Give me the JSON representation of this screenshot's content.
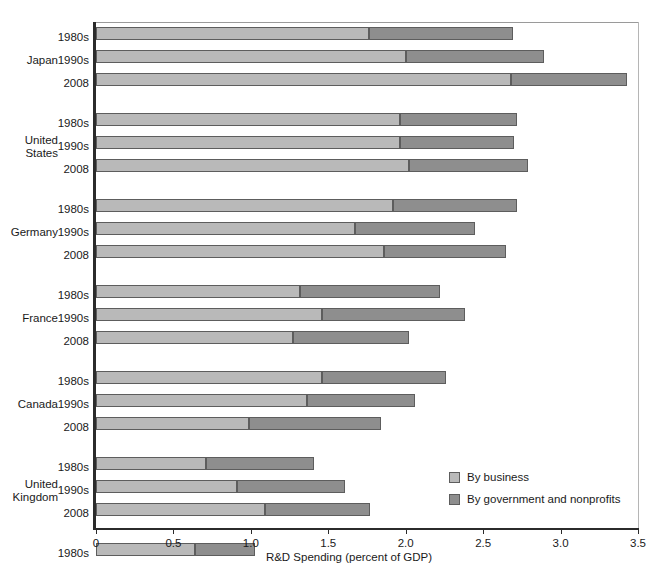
{
  "chart_data": {
    "type": "bar",
    "orientation": "horizontal",
    "stacked": true,
    "title": "",
    "xlabel": "R&D Spending (percent of GDP)",
    "ylabel": "",
    "xlim": [
      0,
      3.5
    ],
    "xticks": [
      "0",
      "0.5",
      "1.0",
      "1.5",
      "2.0",
      "2.5",
      "3.0",
      "3.5"
    ],
    "xtick_values": [
      0,
      0.5,
      1.0,
      1.5,
      2.0,
      2.5,
      3.0,
      3.5
    ],
    "grid": false,
    "legend_position": "inside-bottom-right",
    "series": [
      {
        "name": "By business",
        "color": "#b9b9b9"
      },
      {
        "name": "By government and nonprofits",
        "color": "#8e8e8e"
      }
    ],
    "groups": [
      {
        "country": "Japan",
        "rows": [
          {
            "period": "1980s",
            "business": 1.76,
            "government": 0.93,
            "total": 2.69
          },
          {
            "period": "1990s",
            "business": 2.0,
            "government": 0.89,
            "total": 2.89
          },
          {
            "period": "2008",
            "business": 2.68,
            "government": 0.75,
            "total": 3.43
          }
        ]
      },
      {
        "country": "United States",
        "rows": [
          {
            "period": "1980s",
            "business": 1.96,
            "government": 0.76,
            "total": 2.72
          },
          {
            "period": "1990s",
            "business": 1.96,
            "government": 0.74,
            "total": 2.7
          },
          {
            "period": "2008",
            "business": 2.02,
            "government": 0.77,
            "total": 2.79
          }
        ]
      },
      {
        "country": "Germany",
        "rows": [
          {
            "period": "1980s",
            "business": 1.92,
            "government": 0.8,
            "total": 2.72
          },
          {
            "period": "1990s",
            "business": 1.67,
            "government": 0.78,
            "total": 2.45
          },
          {
            "period": "2008",
            "business": 1.86,
            "government": 0.79,
            "total": 2.65
          }
        ]
      },
      {
        "country": "France",
        "rows": [
          {
            "period": "1980s",
            "business": 1.32,
            "government": 0.9,
            "total": 2.22
          },
          {
            "period": "1990s",
            "business": 1.46,
            "government": 0.92,
            "total": 2.38
          },
          {
            "period": "2008",
            "business": 1.27,
            "government": 0.75,
            "total": 2.02
          }
        ]
      },
      {
        "country": "Canada",
        "rows": [
          {
            "period": "1980s",
            "business": 1.46,
            "government": 0.8,
            "total": 2.26
          },
          {
            "period": "1990s",
            "business": 1.36,
            "government": 0.7,
            "total": 2.06
          },
          {
            "period": "2008",
            "business": 0.99,
            "government": 0.85,
            "total": 1.84
          }
        ]
      },
      {
        "country": "United Kingdom",
        "rows": [
          {
            "period": "1980s",
            "business": 0.71,
            "government": 0.7,
            "total": 1.41
          },
          {
            "period": "1990s",
            "business": 0.91,
            "government": 0.7,
            "total": 1.61
          },
          {
            "period": "2008",
            "business": 1.09,
            "government": 0.68,
            "total": 1.77
          }
        ]
      },
      {
        "country": "Italy",
        "rows": [
          {
            "period": "1980s",
            "business": 0.64,
            "government": 0.39,
            "total": 1.03
          },
          {
            "period": "1990s",
            "business": 0.61,
            "government": 0.49,
            "total": 1.1
          },
          {
            "period": "2008",
            "business": 0.6,
            "government": 0.58,
            "total": 1.18
          }
        ]
      }
    ]
  },
  "legend": {
    "items": [
      {
        "label": "By business",
        "color": "#b9b9b9"
      },
      {
        "label": "By government and nonprofits",
        "color": "#8e8e8e"
      }
    ]
  },
  "axis": {
    "x_title": "R&D Spending (percent of GDP)"
  }
}
